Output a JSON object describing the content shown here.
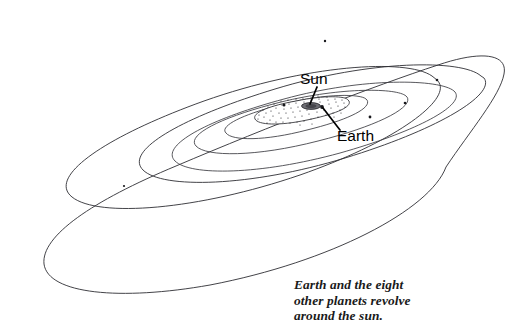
{
  "figure": {
    "kind": "solar-system-orbit-diagram",
    "background_color": "#ffffff",
    "line_color": "#2e2e33",
    "text_color": "#000000",
    "width": 527,
    "height": 334
  },
  "labels": {
    "sun": "Sun",
    "earth": "Earth"
  },
  "caption": {
    "line1": "Earth and the eight",
    "line2": "other planets revolve",
    "line3": "around the sun."
  },
  "diagram_data": {
    "type": "diagram",
    "description": "Perspective view of nested elliptical planetary orbits around the Sun, with one outer eccentric orbit that crosses the next-outermost orbit.",
    "view": {
      "center_x": 312,
      "center_y": 107,
      "tilt_degrees": -21,
      "projection": "oblique perspective, orbits drawn as flattened ellipses"
    },
    "orbits": [
      {
        "name": "inner-stippled-disc",
        "rx": 38,
        "ry": 12,
        "stippled": true
      },
      {
        "name": "orbit-2",
        "rx": 58,
        "ry": 19
      },
      {
        "name": "orbit-3",
        "rx": 96,
        "ry": 31
      },
      {
        "name": "orbit-4",
        "rx": 142,
        "ry": 46
      },
      {
        "name": "orbit-5",
        "rx": 196,
        "ry": 63
      },
      {
        "name": "orbit-6",
        "rx": 243,
        "ry": 78
      },
      {
        "name": "outer-eccentric-orbit",
        "rx": 252,
        "ry": 96,
        "eccentric": true,
        "crosses": "orbit-6"
      }
    ],
    "bodies": [
      {
        "name": "sun",
        "x": 312,
        "y": 106,
        "label": "Sun",
        "kind": "star"
      },
      {
        "name": "earth",
        "x": 322,
        "y": 107,
        "label": "Earth",
        "kind": "planet"
      },
      {
        "name": "planet-dot-orbit3-left",
        "x": 284,
        "y": 105
      },
      {
        "name": "planet-dot-orbit4-right",
        "x": 370,
        "y": 117
      },
      {
        "name": "planet-dot-orbit5-right",
        "x": 405,
        "y": 103
      },
      {
        "name": "planet-dot-orbit6-top",
        "x": 325,
        "y": 41
      },
      {
        "name": "planet-dot-orbit6-right",
        "x": 437,
        "y": 80
      },
      {
        "name": "planet-dot-orbit4-bottom",
        "x": 124,
        "y": 186
      }
    ],
    "leader_lines": [
      {
        "from_label": "Sun",
        "label_x": 301,
        "label_y": 83,
        "tip_x": 311,
        "tip_y": 104
      },
      {
        "from_label": "Earth",
        "label_x": 338,
        "label_y": 140,
        "tip_x": 323,
        "tip_y": 108
      }
    ]
  }
}
